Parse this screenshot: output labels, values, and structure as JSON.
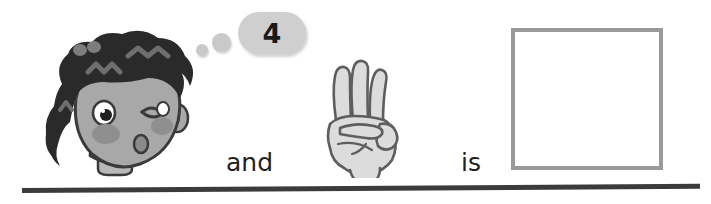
{
  "page": {
    "background_color": "#ffffff",
    "type": "math-worksheet-addition-problem"
  },
  "problem": {
    "thought_bubble": {
      "value": "4",
      "bubble_color": "#cfcfcf",
      "dot_color": "#c9c9c9"
    },
    "connector_and": "and",
    "connector_is": "is",
    "hand": {
      "fingers_shown": "3",
      "skin_color": "#d9d9d9",
      "outline_color": "#595959"
    },
    "answer_box": {
      "value": "",
      "border_color": "#9a9a9a",
      "fill_color": "#ffffff"
    }
  },
  "character": {
    "hair_color": "#2a2a2a",
    "hair_highlight_color": "#6e6e6e",
    "skin_color": "#a8a8a8",
    "cheek_color": "#8f8f8f",
    "outline_color": "#3a3a3a",
    "expression": "winking-whistling"
  },
  "divider": {
    "color": "#3b3b3b"
  }
}
